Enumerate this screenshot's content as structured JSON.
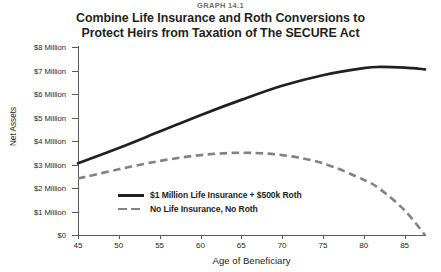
{
  "caption": "GRAPH 14.1",
  "title": {
    "line1": "Combine Life Insurance and Roth Conversions to",
    "line2": "Protect Heirs from Taxation of The SECURE Act"
  },
  "colors": {
    "series_solid": "#231f20",
    "series_dashed": "#808285",
    "axis": "#58595b",
    "text": "#231f20",
    "caption": "#6d6e71",
    "background": "#ffffff"
  },
  "chart_data": {
    "type": "line",
    "title": "Combine Life Insurance and Roth Conversions to Protect Heirs from Taxation of The SECURE Act",
    "subtitle": "GRAPH 14.1",
    "xlabel": "Age of Beneficiary",
    "ylabel": "Net Assets",
    "xlim": [
      45,
      87.5
    ],
    "ylim": [
      0,
      8000000
    ],
    "grid": false,
    "legend_position": "inside-center-lower",
    "xticks": [
      45,
      50,
      55,
      60,
      65,
      70,
      75,
      80,
      85
    ],
    "xtick_labels": [
      "45",
      "50",
      "55",
      "60",
      "65",
      "70",
      "75",
      "80",
      "85"
    ],
    "yticks": [
      0,
      1000000,
      2000000,
      3000000,
      4000000,
      5000000,
      6000000,
      7000000,
      8000000
    ],
    "ytick_labels": [
      "$0",
      "$1 Million",
      "$2 Million",
      "$3 Million",
      "$4 Million",
      "$5 Million",
      "$6 Million",
      "$7 Million",
      "$8 Million"
    ],
    "x": [
      45,
      50,
      55,
      60,
      65,
      70,
      75,
      80,
      82,
      85,
      87.5
    ],
    "series": [
      {
        "name": "$1 Million Life Insurance + $500k Roth",
        "style": "solid",
        "color": "#231f20",
        "values": [
          3050000,
          3700000,
          4400000,
          5100000,
          5750000,
          6350000,
          6800000,
          7100000,
          7150000,
          7120000,
          7050000
        ]
      },
      {
        "name": "No Life Insurance, No Roth",
        "style": "dashed",
        "color": "#808285",
        "values": [
          2400000,
          2800000,
          3150000,
          3400000,
          3500000,
          3400000,
          3050000,
          2350000,
          1950000,
          1050000,
          0
        ]
      }
    ]
  },
  "legend": [
    {
      "label": "$1 Million Life Insurance + $500k Roth",
      "style": "solid"
    },
    {
      "label": "No Life Insurance, No Roth",
      "style": "dashed"
    }
  ]
}
